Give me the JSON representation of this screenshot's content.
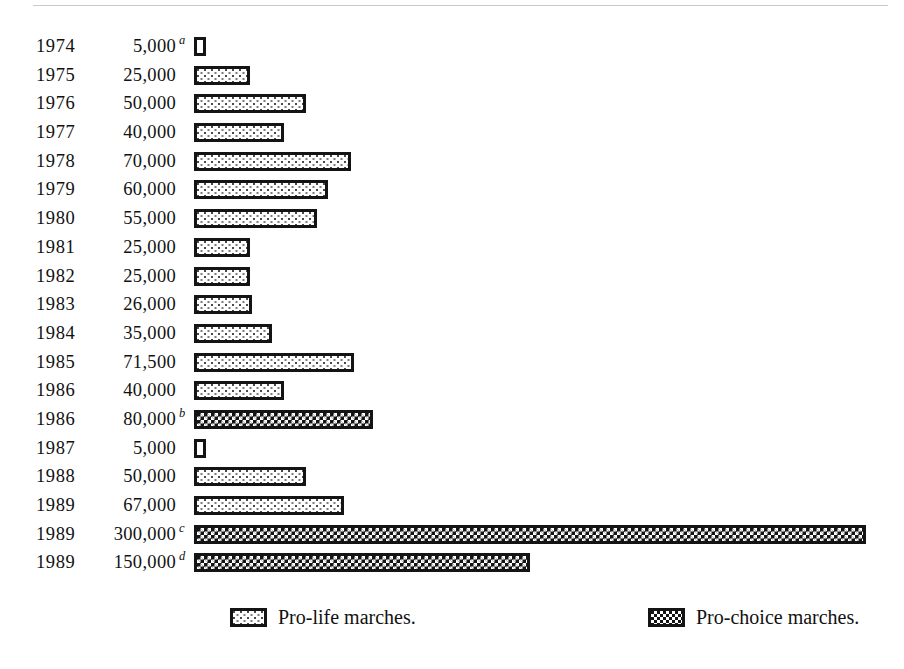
{
  "chart_data": {
    "type": "bar",
    "title": "",
    "xlabel": "",
    "ylabel": "",
    "orientation": "horizontal",
    "grid": false,
    "xlim": [
      0,
      300000
    ],
    "legend_position": "bottom",
    "categories": [
      "1974",
      "1975",
      "1976",
      "1977",
      "1978",
      "1979",
      "1980",
      "1981",
      "1982",
      "1983",
      "1984",
      "1985",
      "1986",
      "1986",
      "1987",
      "1988",
      "1989",
      "1989",
      "1989"
    ],
    "values": [
      5000,
      25000,
      50000,
      40000,
      70000,
      60000,
      55000,
      25000,
      25000,
      26000,
      35000,
      71500,
      40000,
      80000,
      5000,
      50000,
      67000,
      300000,
      150000
    ],
    "series": [
      {
        "name": "Pro-life marches.",
        "key": "prolife",
        "values": [
          5000,
          25000,
          50000,
          40000,
          70000,
          60000,
          55000,
          25000,
          25000,
          26000,
          35000,
          71500,
          40000,
          null,
          5000,
          50000,
          67000,
          null,
          null
        ]
      },
      {
        "name": "Pro-choice marches.",
        "key": "prochoice",
        "values": [
          null,
          null,
          null,
          null,
          null,
          null,
          null,
          null,
          null,
          null,
          null,
          null,
          null,
          80000,
          null,
          null,
          null,
          300000,
          150000
        ]
      }
    ],
    "annotations": [
      "a",
      "",
      "",
      "",
      "",
      "",
      "",
      "",
      "",
      "",
      "",
      "",
      "",
      "b",
      "",
      "",
      "",
      "c",
      "d"
    ]
  },
  "rows": [
    {
      "year": "1974",
      "value": "5,000",
      "note": "a",
      "amount": 5000,
      "series": "prolife"
    },
    {
      "year": "1975",
      "value": "25,000",
      "note": "",
      "amount": 25000,
      "series": "prolife"
    },
    {
      "year": "1976",
      "value": "50,000",
      "note": "",
      "amount": 50000,
      "series": "prolife"
    },
    {
      "year": "1977",
      "value": "40,000",
      "note": "",
      "amount": 40000,
      "series": "prolife"
    },
    {
      "year": "1978",
      "value": "70,000",
      "note": "",
      "amount": 70000,
      "series": "prolife"
    },
    {
      "year": "1979",
      "value": "60,000",
      "note": "",
      "amount": 60000,
      "series": "prolife"
    },
    {
      "year": "1980",
      "value": "55,000",
      "note": "",
      "amount": 55000,
      "series": "prolife"
    },
    {
      "year": "1981",
      "value": "25,000",
      "note": "",
      "amount": 25000,
      "series": "prolife"
    },
    {
      "year": "1982",
      "value": "25,000",
      "note": "",
      "amount": 25000,
      "series": "prolife"
    },
    {
      "year": "1983",
      "value": "26,000",
      "note": "",
      "amount": 26000,
      "series": "prolife"
    },
    {
      "year": "1984",
      "value": "35,000",
      "note": "",
      "amount": 35000,
      "series": "prolife"
    },
    {
      "year": "1985",
      "value": "71,500",
      "note": "",
      "amount": 71500,
      "series": "prolife"
    },
    {
      "year": "1986",
      "value": "40,000",
      "note": "",
      "amount": 40000,
      "series": "prolife"
    },
    {
      "year": "1986",
      "value": "80,000",
      "note": "b",
      "amount": 80000,
      "series": "prochoice"
    },
    {
      "year": "1987",
      "value": "5,000",
      "note": "",
      "amount": 5000,
      "series": "prolife"
    },
    {
      "year": "1988",
      "value": "50,000",
      "note": "",
      "amount": 50000,
      "series": "prolife"
    },
    {
      "year": "1989",
      "value": "67,000",
      "note": "",
      "amount": 67000,
      "series": "prolife"
    },
    {
      "year": "1989",
      "value": "300,000",
      "note": "c",
      "amount": 300000,
      "series": "prochoice"
    },
    {
      "year": "1989",
      "value": "150,000",
      "note": "d",
      "amount": 150000,
      "series": "prochoice"
    }
  ],
  "legend": {
    "prolife_label": "Pro-life marches.",
    "prochoice_label": "Pro-choice marches."
  },
  "colors": {
    "ink": "#141414",
    "paper": "#ffffff",
    "rule": "#c9c9cd"
  }
}
